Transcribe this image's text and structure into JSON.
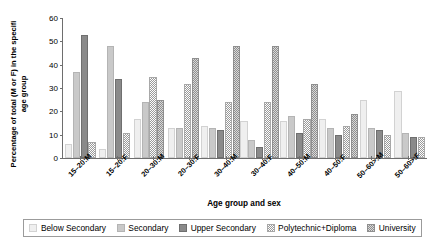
{
  "chart_data": {
    "type": "bar",
    "title": "",
    "xlabel": "Age group and sex",
    "ylabel": "Percentage of total (M or F) in the specifi age group",
    "ylim": [
      0,
      60
    ],
    "yticks": [
      0,
      10,
      20,
      30,
      40,
      50,
      60
    ],
    "grid": false,
    "legend_position": "bottom",
    "categories": [
      "15–20:M",
      "15–20:F",
      "20–30:M",
      "20–30:F",
      "30–40:M",
      "30–40:F",
      "40–50:M",
      "40–50:F",
      "50–60>:M",
      "50–60>:F"
    ],
    "series": [
      {
        "name": "Below Secondary",
        "color": "#efefef",
        "values": [
          5,
          3,
          16,
          12,
          13,
          15,
          15,
          16,
          24,
          28
        ]
      },
      {
        "name": "Secondary",
        "color": "#c9c9c9",
        "values": [
          36,
          47,
          23,
          12,
          12,
          7,
          17,
          12,
          12,
          10
        ]
      },
      {
        "name": "Upper Secondary",
        "color": "#8a8a8a",
        "values": [
          52,
          33,
          0,
          0,
          11,
          4,
          10,
          9,
          11,
          8
        ]
      },
      {
        "name": "Polytechnic+Diploma",
        "color": "#fdfdfd",
        "values": [
          6,
          10,
          34,
          31,
          23,
          23,
          16,
          13,
          9,
          8
        ]
      },
      {
        "name": "University",
        "color": "#d9d9d9",
        "values": [
          0,
          0,
          24,
          42,
          47,
          47,
          31,
          18,
          0,
          0
        ]
      }
    ]
  },
  "axis": {
    "y_title": "Percentage of total (M or F) in the specifi age group",
    "x_title": "Age group and sex",
    "y_tick_labels": [
      "0",
      "10",
      "20",
      "30",
      "40",
      "50",
      "60"
    ],
    "x_tick_labels": [
      "15–20:M",
      "15–20:F",
      "20–30:M",
      "20–30:F",
      "30–40:M",
      "30–40:F",
      "40–50:M",
      "40–50:F",
      "50–60>:M",
      "50–60>:F"
    ]
  },
  "legend": {
    "entries": [
      {
        "label": "Below Secondary"
      },
      {
        "label": "Secondary"
      },
      {
        "label": "Upper Secondary"
      },
      {
        "label": "Polytechnic+Diploma"
      },
      {
        "label": "University"
      }
    ]
  }
}
